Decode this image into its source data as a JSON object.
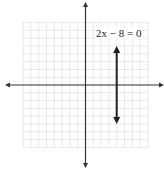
{
  "chart_data": {
    "type": "line",
    "title": "",
    "xlabel": "",
    "ylabel": "",
    "xlim": [
      -8,
      8
    ],
    "ylim": [
      -8,
      8
    ],
    "grid": true,
    "grid_step": 1,
    "legend": null,
    "axes": {
      "x_arrows": true,
      "y_arrows": true,
      "tick_labels": false
    },
    "series": [
      {
        "name": "2x − 8 = 0",
        "kind": "vertical-line",
        "x": 4,
        "y_range": [
          -5,
          5
        ],
        "arrows": "both"
      }
    ],
    "annotations": [
      {
        "text": "2x − 8 = 0",
        "x": 4,
        "y": 6.5
      }
    ]
  },
  "equation_label": "2x − 8 = 0",
  "colors": {
    "grid": "#d4d4d4",
    "axis": "#333333",
    "line": "#222222",
    "background": "#ffffff"
  }
}
